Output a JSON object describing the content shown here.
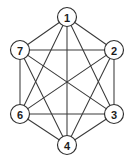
{
  "figure": {
    "background_color": "#ffffff",
    "width": 134,
    "height": 159
  },
  "style": {
    "edge_color": "#3a3a3a",
    "edge_width": 1.05,
    "node_fill": "#ffffff",
    "node_stroke": "#2e2e2e",
    "node_stroke_width": 1.15,
    "node_radius": 9.5,
    "label_color": "#1d1d1d",
    "label_font_size": 11
  },
  "chart_data": {
    "type": "diagram",
    "subtype": "graph",
    "layout": "hexagonal",
    "directed": false,
    "node_count": 6,
    "edge_count": 15,
    "nodes": [
      {
        "id": "n1",
        "label": "1",
        "x": 67,
        "y": 17,
        "position": "top"
      },
      {
        "id": "n2",
        "label": "2",
        "x": 114,
        "y": 50,
        "position": "upper-right"
      },
      {
        "id": "n3",
        "label": "3",
        "x": 114,
        "y": 114,
        "position": "lower-right"
      },
      {
        "id": "n4",
        "label": "4",
        "x": 67,
        "y": 145,
        "position": "bottom"
      },
      {
        "id": "n6",
        "label": "6",
        "x": 20,
        "y": 114,
        "position": "lower-left"
      },
      {
        "id": "n7",
        "label": "7",
        "x": 20,
        "y": 50,
        "position": "upper-left"
      }
    ],
    "edges": [
      {
        "from": "n1",
        "to": "n2"
      },
      {
        "from": "n1",
        "to": "n3"
      },
      {
        "from": "n1",
        "to": "n4"
      },
      {
        "from": "n1",
        "to": "n6"
      },
      {
        "from": "n1",
        "to": "n7"
      },
      {
        "from": "n2",
        "to": "n3"
      },
      {
        "from": "n2",
        "to": "n4"
      },
      {
        "from": "n2",
        "to": "n6"
      },
      {
        "from": "n2",
        "to": "n7"
      },
      {
        "from": "n3",
        "to": "n4"
      },
      {
        "from": "n3",
        "to": "n6"
      },
      {
        "from": "n3",
        "to": "n7"
      },
      {
        "from": "n4",
        "to": "n6"
      },
      {
        "from": "n4",
        "to": "n7"
      },
      {
        "from": "n6",
        "to": "n7"
      }
    ]
  }
}
